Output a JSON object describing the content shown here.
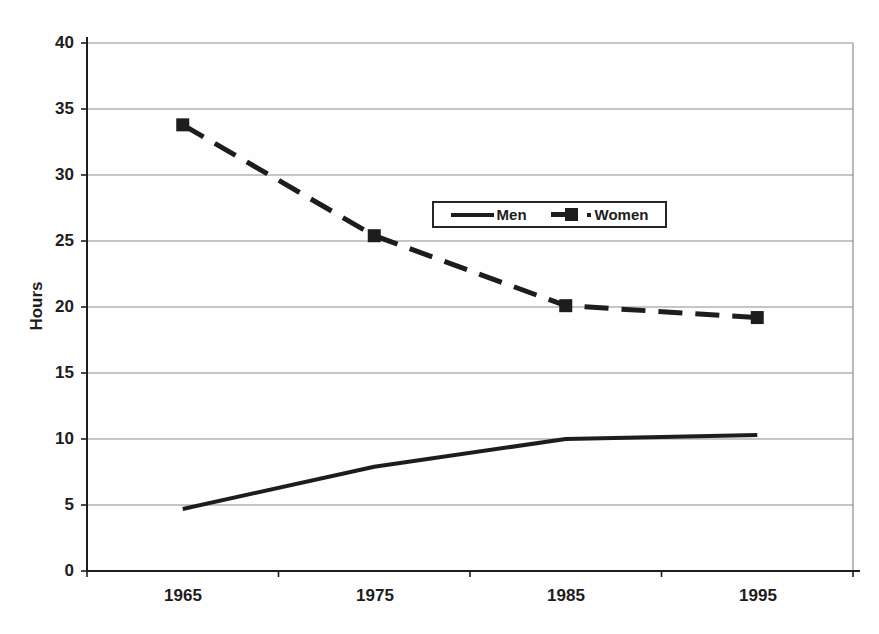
{
  "chart_data": {
    "type": "line",
    "title": "",
    "xlabel": "",
    "ylabel": "Hours",
    "categories": [
      "1965",
      "1975",
      "1985",
      "1995"
    ],
    "series": [
      {
        "name": "Men",
        "line_style": "solid",
        "marker": "none",
        "values": [
          4.7,
          7.9,
          10.0,
          10.3
        ]
      },
      {
        "name": "Women",
        "line_style": "dashed",
        "marker": "square",
        "values": [
          33.8,
          25.4,
          20.1,
          19.2
        ]
      }
    ],
    "ylim": [
      0,
      40
    ],
    "ytick_step": 5,
    "ytick_labels_top_to_bottom": [
      "40",
      "35",
      "30",
      "25",
      "20",
      "15",
      "10",
      "5",
      "0"
    ],
    "grid": "horizontal",
    "legend": {
      "position": "inside-top-center",
      "entries": [
        "Men",
        "Women"
      ]
    },
    "ink_color": "#1d1d1d",
    "grid_color": "#8d8d8d",
    "background": "#fefefe"
  }
}
